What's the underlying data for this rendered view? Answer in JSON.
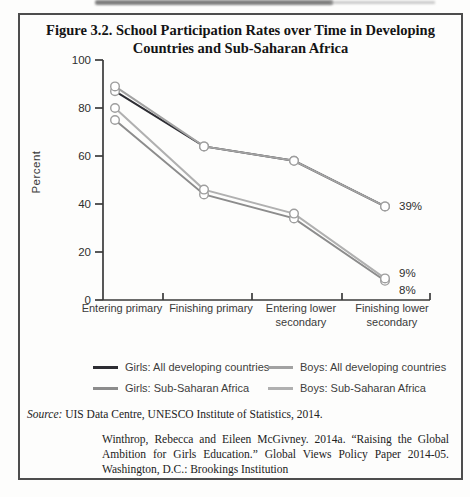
{
  "figure": {
    "title_lines": [
      "Figure 3.2. School Participation Rates over Time in Developing",
      "Countries and Sub-Saharan Africa"
    ],
    "source": {
      "prefix": "Source:",
      "text": " UIS Data Centre, UNESCO Institute of Statistics, 2014."
    },
    "citation": "Winthrop, Rebecca and Eileen McGivney. 2014a. “Raising the Global Ambition for Girls Education.” Global Views Policy Paper 2014-05. Washington, D.C.: Brookings Institution"
  },
  "chart_data": {
    "type": "line",
    "title": "Figure 3.2. School Participation Rates over Time in Developing Countries and Sub-Saharan Africa",
    "ylabel": "Percent",
    "xlabel": "",
    "ylim": [
      0,
      100
    ],
    "yticks": [
      0,
      20,
      40,
      60,
      80,
      100
    ],
    "grid": false,
    "legend_position": "bottom",
    "marker": "open-circle",
    "categories": [
      "Entering primary",
      "Finishing primary",
      "Entering lower\nsecondary",
      "Finishing lower\nsecondary"
    ],
    "series": [
      {
        "name": "Girls: All developing countries",
        "color": "#2d2d33",
        "values": [
          87,
          64,
          58,
          39
        ]
      },
      {
        "name": "Boys: All developing countries",
        "color": "#a2a2a2",
        "values": [
          89,
          64,
          58,
          39
        ]
      },
      {
        "name": "Girls: Sub-Saharan Africa",
        "color": "#8c8c8c",
        "values": [
          75,
          44,
          34,
          8
        ]
      },
      {
        "name": "Boys: Sub-Saharan Africa",
        "color": "#b0b0b0",
        "values": [
          80,
          46,
          36,
          9
        ]
      }
    ],
    "end_labels": [
      {
        "text": "39%",
        "series": 1,
        "dy": 0
      },
      {
        "text": "9%",
        "series": 3,
        "dy": -5
      },
      {
        "text": "8%",
        "series": 2,
        "dy": 9
      }
    ],
    "marker_stroke": "#9e9e9e",
    "axis_color": "#3a3a3a"
  }
}
